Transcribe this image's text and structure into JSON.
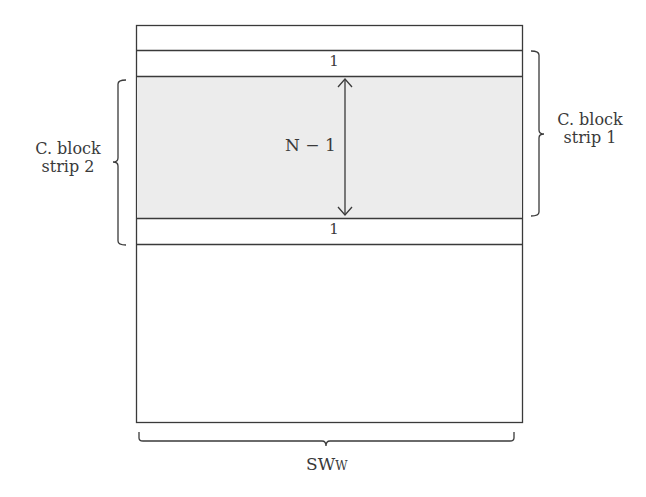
{
  "diagram": {
    "labels": {
      "top_row": "1",
      "bottom_row": "1",
      "middle_height": "N − 1",
      "left_brace": {
        "line1": "C. block",
        "line2": "strip 2"
      },
      "right_brace": {
        "line1": "C. block",
        "line2": "strip 1"
      },
      "width_main": "SW",
      "width_sub": "W"
    },
    "colors": {
      "stroke": "#3a3a3a",
      "shaded_fill": "#ececec",
      "background": "#ffffff"
    }
  }
}
